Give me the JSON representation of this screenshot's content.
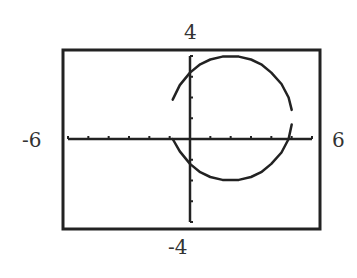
{
  "labels": {
    "ymax": "4",
    "ymin": "-4",
    "xmin": "-6",
    "xmax": "6"
  },
  "colors": {
    "ink": "#222222",
    "background": "#ffffff"
  },
  "chart_data": {
    "type": "line",
    "title": "",
    "xlabel": "",
    "ylabel": "",
    "xlim": [
      -6,
      6
    ],
    "ylim": [
      -4,
      4
    ],
    "xscale_ticks": 1,
    "yscale_ticks": 1,
    "grid": false,
    "window_labels": {
      "xmin": "-6",
      "xmax": "6",
      "ymin": "-4",
      "ymax": "4"
    },
    "series": [
      {
        "name": "upper arc",
        "description": "y = 1 + sqrt(9 - (x-2)^2), from left end near x=-0.9 over the top to right side",
        "points": [
          [
            -0.85,
            1.9
          ],
          [
            -0.5,
            2.6
          ],
          [
            0,
            3.2
          ],
          [
            0.5,
            3.6
          ],
          [
            1,
            3.83
          ],
          [
            1.6,
            3.97
          ],
          [
            2.4,
            3.97
          ],
          [
            3,
            3.83
          ],
          [
            3.5,
            3.6
          ],
          [
            4,
            3.2
          ],
          [
            4.5,
            2.65
          ],
          [
            4.85,
            2.0
          ],
          [
            5.0,
            1.4
          ]
        ]
      },
      {
        "name": "lower arc",
        "description": "y = 1 - sqrt(9 - (x-2)^2), from right side near y=0.7 down around bottom to left near the x-axis",
        "points": [
          [
            5.0,
            0.7
          ],
          [
            4.85,
            0.0
          ],
          [
            4.5,
            -0.65
          ],
          [
            4,
            -1.2
          ],
          [
            3.5,
            -1.6
          ],
          [
            3,
            -1.83
          ],
          [
            2.4,
            -1.97
          ],
          [
            1.6,
            -1.97
          ],
          [
            1,
            -1.83
          ],
          [
            0.5,
            -1.6
          ],
          [
            0,
            -1.2
          ],
          [
            -0.5,
            -0.6
          ],
          [
            -0.85,
            0.0
          ]
        ]
      }
    ],
    "implied_relation": "(x-2)^2 + (y-1)^2 = 9"
  }
}
